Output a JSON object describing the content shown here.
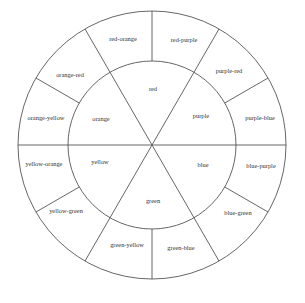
{
  "diagram": {
    "type": "color-wheel",
    "center": [
      152,
      145
    ],
    "inner_radius": 84,
    "outer_radius": 134,
    "line_color": "#555555",
    "inner_segments": [
      {
        "label": "red",
        "pos": [
          153,
          90
        ]
      },
      {
        "label": "purple",
        "pos": [
          201,
          117
        ]
      },
      {
        "label": "blue",
        "pos": [
          203,
          166
        ]
      },
      {
        "label": "green",
        "pos": [
          153,
          202
        ]
      },
      {
        "label": "yellow",
        "pos": [
          100,
          163
        ]
      },
      {
        "label": "orange",
        "pos": [
          101,
          120
        ]
      }
    ],
    "outer_segments": [
      {
        "label": "red-purple",
        "pos": [
          184,
          41
        ]
      },
      {
        "label": "purple-red",
        "pos": [
          229,
          72
        ]
      },
      {
        "label": "purple-blue",
        "pos": [
          260,
          119
        ]
      },
      {
        "label": "blue-purple",
        "pos": [
          261,
          167
        ]
      },
      {
        "label": "blue-green",
        "pos": [
          238,
          214
        ]
      },
      {
        "label": "green-blue",
        "pos": [
          181,
          249
        ]
      },
      {
        "label": "green-yellow",
        "pos": [
          127,
          246
        ]
      },
      {
        "label": "yellow-green",
        "pos": [
          66,
          212
        ]
      },
      {
        "label": "yellow-orange",
        "pos": [
          44,
          165
        ]
      },
      {
        "label": "orange-yellow",
        "pos": [
          46,
          119
        ]
      },
      {
        "label": "orange-red",
        "pos": [
          70,
          76
        ]
      },
      {
        "label": "red-orange",
        "pos": [
          123,
          40
        ]
      }
    ]
  }
}
